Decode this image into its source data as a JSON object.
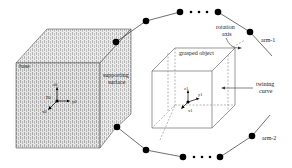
{
  "diagram": {
    "labels": {
      "base": "base",
      "supporting_surface_line1": "supporting",
      "supporting_surface_line2": "surface",
      "grasped_object": "grasped object",
      "rotation_axis_line1": "rotation",
      "rotation_axis_line2": "axis",
      "twining_curve_line1": "twining",
      "twining_curve_line2": "curve",
      "arm1": "arm-1",
      "arm2": "arm-2",
      "ellipsis_top": "• • •",
      "ellipsis_bottom": "• • •"
    },
    "frames": {
      "base_frame": {
        "origin": "Σ0",
        "x": "x0",
        "y": "y0",
        "z": "z0"
      },
      "object_frame": {
        "origin": "Σ1",
        "x": "x1",
        "y": "y1",
        "z": "z1"
      }
    },
    "colors": {
      "line": "#333333",
      "joint": "#000000",
      "hatch_fill": "#d8d8d8",
      "dashed": "#888888"
    }
  }
}
